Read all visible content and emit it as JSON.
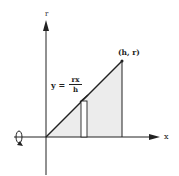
{
  "diagram": {
    "y_axis_label": "r",
    "x_axis_label": "x",
    "point_label": "(h, r)",
    "equation": {
      "lhs": "y =",
      "numerator": "rx",
      "denominator": "h"
    },
    "rotation_icon": "rotation-arrow-icon",
    "colors": {
      "stroke": "#222222",
      "fill": "#ececec"
    }
  }
}
